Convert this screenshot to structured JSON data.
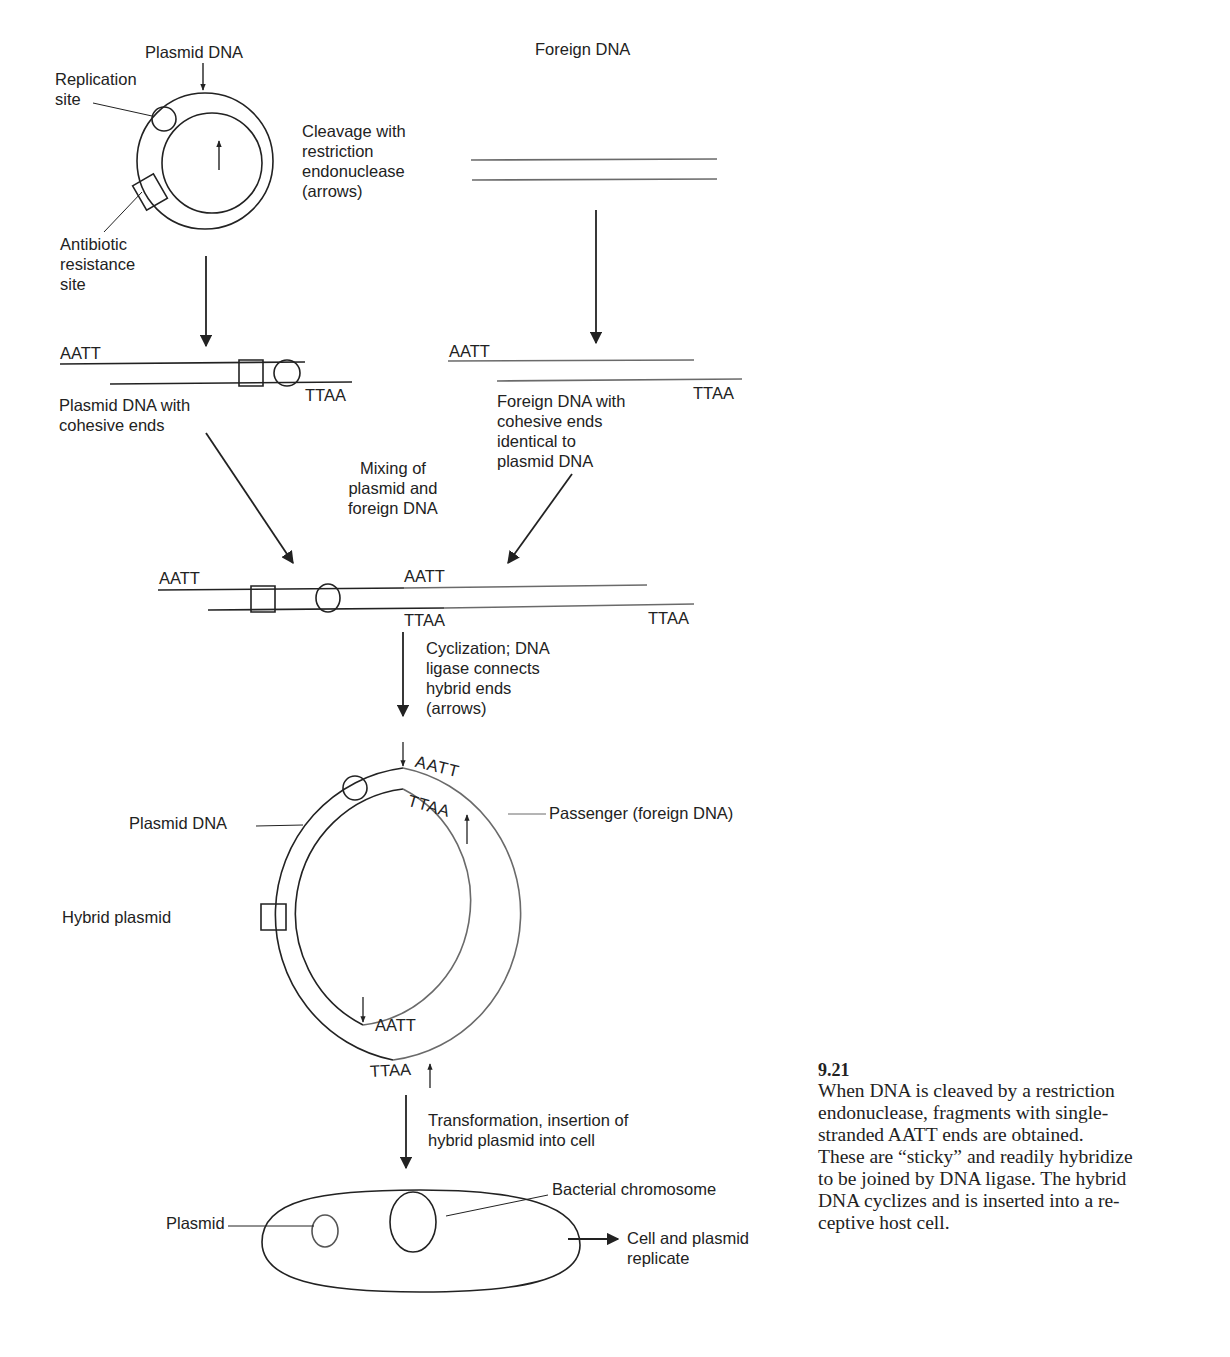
{
  "figure": {
    "number": "9.21",
    "caption": "When DNA is cleaved by a restriction\nendonuclease, fragments with single-\nstranded AATT ends are obtained.\nThese are “sticky” and readily hybridize\nto be joined by DNA ligase. The hybrid\nDNA cyclizes and is inserted into a re-\nceptive host cell."
  },
  "stage1": {
    "plasmid_title": "Plasmid DNA",
    "replication_site": "Replication\nsite",
    "antibiotic_site": "Antibiotic\nresistance\nsite",
    "cleavage_label": "Cleavage with\nrestriction\nendonuclease\n(arrows)",
    "foreign_title": "Foreign DNA"
  },
  "stage2": {
    "plasmid_top_seq": "AATT",
    "plasmid_bottom_seq": "TTAA",
    "plasmid_label": "Plasmid DNA with\ncohesive ends",
    "foreign_top_seq": "AATT",
    "foreign_bottom_seq": "TTAA",
    "foreign_label": "Foreign DNA with\ncohesive ends\nidentical to\nplasmid DNA",
    "mixing_label": "Mixing of\nplasmid and\nforeign DNA"
  },
  "stage3": {
    "left_top_seq": "AATT",
    "mid_top_seq": "AATT",
    "mid_bottom_seq": "TTAA",
    "right_bottom_seq": "TTAA",
    "cyclization_label": "Cyclization; DNA\nligase connects\nhybrid ends\n(arrows)"
  },
  "stage4": {
    "plasmid_dna_label": "Plasmid DNA",
    "hybrid_label": "Hybrid plasmid",
    "passenger_label": "Passenger (foreign DNA)",
    "top_outer_seq": "AATT",
    "top_inner_seq": "TTAA",
    "bottom_inner_seq": "AATT",
    "bottom_outer_seq": "TTAA",
    "transformation_label": "Transformation, insertion of\nhybrid plasmid into cell"
  },
  "stage5": {
    "plasmid_label": "Plasmid",
    "chromosome_label": "Bacterial chromosome",
    "replicate_label": "Cell and plasmid\nreplicate"
  },
  "colors": {
    "ink": "#222222",
    "foreign_ink": "#6a6a6a",
    "background": "#ffffff"
  }
}
